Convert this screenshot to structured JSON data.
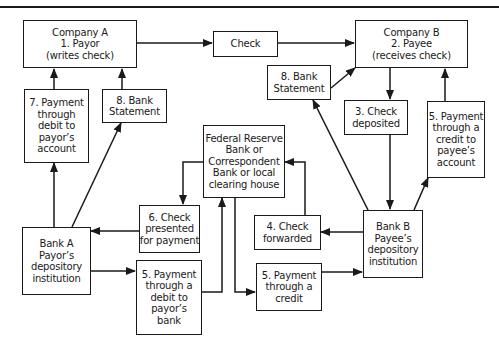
{
  "diagram": {
    "title": "",
    "nodes": {
      "company_a": {
        "lines": [
          "Company A",
          "1. Payor",
          "(writes check)"
        ]
      },
      "check": {
        "lines": [
          "Check"
        ]
      },
      "company_b": {
        "lines": [
          "Company B",
          "2. Payee",
          "(receives check)"
        ]
      },
      "payment_debit_payor_account": {
        "lines": [
          "7. Payment",
          "through",
          "debit to",
          "payor’s",
          "account"
        ]
      },
      "bank_statement_a": {
        "lines": [
          "8. Bank",
          "Statement"
        ]
      },
      "bank_statement_b": {
        "lines": [
          "8. Bank",
          "Statement"
        ]
      },
      "check_deposited": {
        "lines": [
          "3. Check",
          "deposited"
        ]
      },
      "payment_credit_payee_account": {
        "lines": [
          "5. Payment",
          "through a",
          "credit to",
          "payee’s",
          "account"
        ]
      },
      "federal_reserve": {
        "lines": [
          "Federal Reserve",
          "Bank or",
          "Correspondent",
          "Bank or local",
          "clearing house"
        ]
      },
      "check_presented": {
        "lines": [
          "6. Check",
          "presented",
          "for payment"
        ]
      },
      "check_forwarded": {
        "lines": [
          "4. Check",
          "forwarded"
        ]
      },
      "bank_a": {
        "lines": [
          "Bank A",
          "Payor’s",
          "depository",
          "institution"
        ]
      },
      "bank_b": {
        "lines": [
          "Bank B",
          "Payee’s",
          "depository",
          "institution"
        ]
      },
      "payment_debit_payor_bank": {
        "lines": [
          "5. Payment",
          "through a",
          "debit to",
          "payor’s",
          "bank"
        ]
      },
      "payment_credit": {
        "lines": [
          "5. Payment",
          "through a",
          "credit"
        ]
      }
    },
    "edges": [
      {
        "from": "company_a",
        "to": "check"
      },
      {
        "from": "check",
        "to": "company_b"
      },
      {
        "from": "company_b",
        "to": "check_deposited"
      },
      {
        "from": "check_deposited",
        "to": "bank_b"
      },
      {
        "from": "bank_b",
        "to": "check_forwarded"
      },
      {
        "from": "check_forwarded",
        "to": "federal_reserve"
      },
      {
        "from": "federal_reserve",
        "to": "check_presented"
      },
      {
        "from": "check_presented",
        "to": "bank_a"
      },
      {
        "from": "bank_a",
        "to": "payment_debit_payor_bank"
      },
      {
        "from": "payment_debit_payor_bank",
        "to": "federal_reserve"
      },
      {
        "from": "federal_reserve",
        "to": "payment_credit"
      },
      {
        "from": "payment_credit",
        "to": "bank_b"
      },
      {
        "from": "bank_b",
        "to": "payment_credit_payee_account"
      },
      {
        "from": "payment_credit_payee_account",
        "to": "company_b"
      },
      {
        "from": "bank_a",
        "to": "payment_debit_payor_account"
      },
      {
        "from": "payment_debit_payor_account",
        "to": "company_a"
      },
      {
        "from": "bank_a",
        "to": "bank_statement_a"
      },
      {
        "from": "bank_statement_a",
        "to": "company_a"
      },
      {
        "from": "bank_b",
        "to": "bank_statement_b"
      },
      {
        "from": "bank_statement_b",
        "to": "company_b"
      }
    ],
    "colors": {
      "line": "#1a1a1a",
      "background": "#ffffff"
    }
  }
}
